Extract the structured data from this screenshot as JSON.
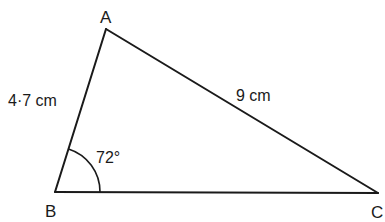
{
  "figure": {
    "type": "triangle",
    "stroke_color": "#1a1a1a",
    "background": "#ffffff",
    "vertices": {
      "A": {
        "label": "A",
        "x": 106,
        "y": 29
      },
      "B": {
        "label": "B",
        "x": 55,
        "y": 192
      },
      "C": {
        "label": "C",
        "x": 378,
        "y": 193
      }
    },
    "sides": {
      "AB": {
        "label": "4·7 cm"
      },
      "AC": {
        "label": "9 cm"
      },
      "BC": {
        "label": ""
      }
    },
    "angles": {
      "B": {
        "label": "72°",
        "arc_radius": 45
      }
    }
  }
}
